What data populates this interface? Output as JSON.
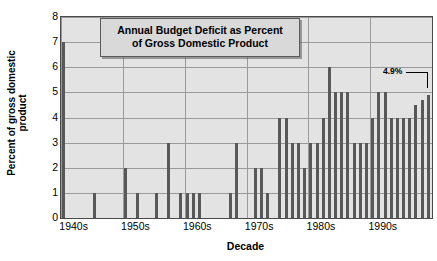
{
  "chart": {
    "title_line1": "Annual Budget Deficit as Percent",
    "title_line2": "of Gross Domestic Product",
    "ylabel_line1": "Percent of gross domestic",
    "ylabel_line2": "product",
    "xlabel": "Decade",
    "annotation": "4.9%",
    "plot_bg": "#e3e3e3",
    "bar_color": "#585858",
    "grid_color": "#9a9a9a",
    "border_color": "#4a4a4a"
  },
  "chart_data": {
    "type": "bar",
    "title": "Annual Budget Deficit as Percent of Gross Domestic Product",
    "xlabel": "Decade",
    "ylabel": "Percent of gross domestic product",
    "ylim": [
      0,
      8
    ],
    "yticks": [
      0,
      1,
      2,
      3,
      4,
      5,
      6,
      7,
      8
    ],
    "xtick_labels": [
      "1940s",
      "1950s",
      "1960s",
      "1970s",
      "1980s",
      "1990s"
    ],
    "xtick_years": [
      1940,
      1950,
      1960,
      1970,
      1980,
      1990
    ],
    "grid": true,
    "legend": false,
    "annotations": [
      {
        "text": "4.9%",
        "year": 1999,
        "value": 4.9
      }
    ],
    "x": [
      1940,
      1941,
      1942,
      1943,
      1944,
      1945,
      1946,
      1947,
      1948,
      1949,
      1950,
      1951,
      1952,
      1953,
      1954,
      1955,
      1956,
      1957,
      1958,
      1959,
      1960,
      1961,
      1962,
      1963,
      1964,
      1965,
      1966,
      1967,
      1968,
      1969,
      1970,
      1971,
      1972,
      1973,
      1974,
      1975,
      1976,
      1977,
      1978,
      1979,
      1980,
      1981,
      1982,
      1983,
      1984,
      1985,
      1986,
      1987,
      1988,
      1989,
      1990,
      1991,
      1992,
      1993,
      1994,
      1995,
      1996,
      1997,
      1998,
      1999
    ],
    "values": [
      7,
      0,
      0,
      0,
      0,
      1,
      0,
      0,
      0,
      0,
      2,
      0,
      1,
      0,
      0,
      1,
      0,
      3,
      0,
      1,
      1,
      1,
      1,
      0,
      0,
      0,
      0,
      1,
      3,
      0,
      0,
      2,
      2,
      1,
      0,
      4,
      4,
      3,
      3,
      2,
      3,
      3,
      4,
      6,
      5,
      5,
      5,
      3,
      3,
      3,
      4,
      5,
      5,
      4,
      4,
      4,
      4,
      4.5,
      4.7,
      4.9
    ]
  }
}
